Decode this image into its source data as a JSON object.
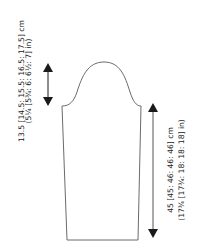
{
  "diagram": {
    "type": "sleeve-schematic",
    "stroke_color": "#6b6b6b",
    "arrow_color": "#1a1a1a",
    "text_color": "#1a1a1a",
    "cap_height": {
      "cm": "13.5 [14.5: 15.5: 16.5: 17.5] cm",
      "in": "(5¼ [5¾: 6: 6½: 7] in)"
    },
    "sleeve_length": {
      "cm": "45 [45: 46: 46: 46] cm",
      "in": "(17¾ [17¾: 18: 18: 18] in)"
    }
  }
}
